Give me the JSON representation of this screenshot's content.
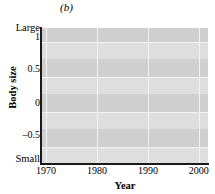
{
  "figure": {
    "panel_letter": "(b)",
    "background": "#d4d4d4",
    "band_light": "#dedede",
    "band_dark": "#cfcfcf",
    "gridline_color": "#f2f2f2",
    "line_color": "#1a1a1a"
  },
  "axes": {
    "y_top_label": "Large",
    "y_bottom_label": "Small",
    "y_title": "Body size",
    "x_title": "Year",
    "y_ticks": [
      "1",
      "0.5",
      "0",
      "-0.5"
    ],
    "y_tick_display": [
      "1",
      "0.5",
      "0",
      "–0.5"
    ],
    "x_ticks": [
      "1970",
      "1980",
      "1990",
      "2000"
    ]
  },
  "chart_data": {
    "type": "line",
    "title": "(b)",
    "xlabel": "Year",
    "ylabel": "Body size",
    "ylim": [
      -0.75,
      1.2
    ],
    "xlim": [
      1969.2,
      2001.8
    ],
    "grid": true,
    "legend": null,
    "y_axis_endpoint_labels": {
      "top": "Large",
      "bottom": "Small"
    },
    "y_tick_values": [
      1,
      0.5,
      0,
      -0.5
    ],
    "x_tick_values": [
      1970,
      1980,
      1990,
      2000
    ],
    "series": [
      {
        "name": "Body size",
        "color": "#1a1a1a",
        "x": [
          1972.0,
          1973.0,
          1973.6,
          1974.4,
          1975.0,
          1975.6,
          1976.2,
          1977.0,
          1977.8,
          1978.6,
          1979.4,
          1980.0,
          1980.6,
          1981.2,
          1981.8,
          1982.4,
          1983.0,
          1983.6,
          1984.4,
          1985.2,
          1986.0,
          1986.8,
          1987.4,
          1988.2,
          1989.0,
          1990.0,
          1991.0,
          1992.0,
          1992.8,
          1993.6,
          1994.4,
          1995.2,
          1996.0,
          1996.8,
          1997.4,
          1998.0,
          1998.8,
          1999.4,
          2000.0,
          2000.6,
          2001.2
        ],
        "y": [
          0.6,
          0.42,
          0.41,
          0.36,
          0.34,
          -0.05,
          -0.11,
          -0.11,
          0.18,
          0.42,
          0.55,
          0.62,
          0.61,
          0.5,
          0.47,
          0.49,
          0.42,
          0.4,
          0.35,
          0.32,
          0.22,
          0.05,
          -0.1,
          -0.17,
          -0.17,
          -0.18,
          -0.21,
          -0.27,
          -0.28,
          -0.25,
          -0.23,
          -0.24,
          -0.2,
          -0.27,
          -0.17,
          -0.24,
          -0.17,
          -0.16,
          -0.08,
          -0.06,
          -0.28
        ]
      }
    ]
  }
}
